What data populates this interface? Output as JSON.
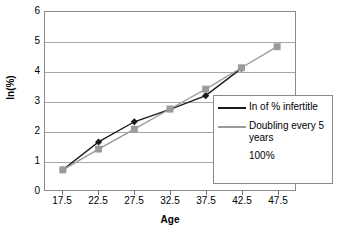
{
  "chart_data": {
    "type": "line",
    "title": "",
    "xlabel": "Age",
    "ylabel": "ln(%)",
    "categories": [
      "17.5",
      "22.5",
      "27.5",
      "32.5",
      "37.5",
      "42.5",
      "47.5"
    ],
    "x": [
      17.5,
      22.5,
      27.5,
      32.5,
      37.5,
      42.5,
      47.5
    ],
    "xlim": [
      15,
      50
    ],
    "ylim": [
      0,
      6
    ],
    "y_ticks": [
      "0",
      "1",
      "2",
      "3",
      "4",
      "5",
      "6"
    ],
    "y_tick_values": [
      0,
      1,
      2,
      3,
      4,
      5,
      6
    ],
    "grid": true,
    "legend_position": "inside-bottom-right",
    "series": [
      {
        "name": "In of % infertitle",
        "marker": "diamond",
        "color": "#1a1a1a",
        "values": [
          0.68,
          1.62,
          2.3,
          2.72,
          3.18,
          4.1,
          null
        ]
      },
      {
        "name": "Doubling every 5 years",
        "marker": "square",
        "color": "#9a9a9a",
        "values": [
          0.68,
          1.38,
          2.05,
          2.73,
          3.4,
          4.12,
          4.83
        ]
      }
    ],
    "legend_entries": [
      {
        "label": "In of % infertitle",
        "marker": "diamond",
        "color": "#1a1a1a"
      },
      {
        "label": "Doubling every 5 years",
        "marker": "square",
        "color": "#9a9a9a"
      }
    ],
    "annotations": [
      "100%"
    ]
  },
  "axes": {
    "y_title": "ln(%)",
    "x_title": "Age"
  },
  "legend": {
    "entry_0_label": "In of % infertitle",
    "entry_1_label": "Doubling every 5 years",
    "extra_label": "100%"
  },
  "colors": {
    "series_black": "#1a1a1a",
    "series_gray": "#9a9a9a",
    "gridline": "#a8a8a8",
    "frame": "#8a8a8a",
    "background": "#ffffff"
  }
}
